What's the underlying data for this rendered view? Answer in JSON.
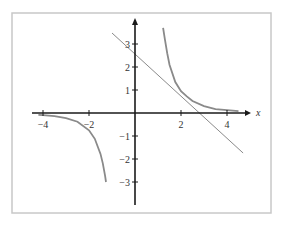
{
  "chart_data": {
    "type": "line",
    "title": "",
    "xlabel": "x",
    "ylabel": "",
    "xlim": [
      -4.3,
      4.8
    ],
    "ylim": [
      -3.8,
      4.0
    ],
    "grid": false,
    "legend": null,
    "x_ticks": [
      -4,
      -2,
      2,
      4
    ],
    "x_tick_labels": [
      "−4",
      "−2",
      "2",
      "4"
    ],
    "y_ticks": [
      -3,
      -2,
      -1,
      1,
      2,
      3
    ],
    "y_tick_labels": [
      "−3",
      "−2",
      "−1",
      "1",
      "2",
      "3"
    ],
    "series": [
      {
        "name": "curve-left-branch",
        "x": [
          -4.2,
          -4,
          -3.5,
          -3,
          -2.5,
          -2,
          -1.75,
          -1.5,
          -1.4,
          -1.3,
          -1.26
        ],
        "y": [
          -0.08,
          -0.09,
          -0.14,
          -0.22,
          -0.38,
          -0.75,
          -1.12,
          -1.78,
          -2.19,
          -2.73,
          -3.0
        ]
      },
      {
        "name": "curve-right-branch",
        "x": [
          1.22,
          1.3,
          1.4,
          1.5,
          1.75,
          2,
          2.25,
          2.5,
          3,
          3.5,
          4,
          4.5
        ],
        "y": [
          3.7,
          3.2,
          2.6,
          2.1,
          1.35,
          0.95,
          0.72,
          0.52,
          0.3,
          0.17,
          0.12,
          0.08
        ]
      },
      {
        "name": "tangent-line",
        "x": [
          -1.0,
          4.7
        ],
        "y": [
          3.48,
          -1.74
        ]
      }
    ]
  },
  "axes": {
    "x_label": "x",
    "x_tick_labels": [
      "−4",
      "−2",
      "2",
      "4"
    ],
    "y_tick_labels": [
      "3",
      "2",
      "1",
      "−1",
      "−2",
      "−3"
    ]
  }
}
